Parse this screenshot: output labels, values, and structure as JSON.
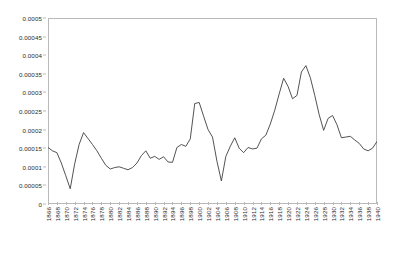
{
  "chart_data": {
    "type": "line",
    "title": "",
    "subtitle": "",
    "xlabel": "",
    "ylabel": "",
    "xlim": [
      1866,
      1940
    ],
    "ylim": [
      0,
      0.0005
    ],
    "grid": false,
    "legend": false,
    "legend_position": "none",
    "line_color": "#404040",
    "y_ticks": [
      0,
      5e-05,
      0.0001,
      0.00015,
      0.0002,
      0.00025,
      0.0003,
      0.00035,
      0.0004,
      0.00045,
      0.0005
    ],
    "y_tick_labels": [
      "0",
      "0.00005",
      "0.0001",
      "0.00015",
      "0.0002",
      "0.00025",
      "0.0003",
      "0.00035",
      "0.0004",
      "0.00045",
      "0.0005"
    ],
    "x_ticks": [
      1866,
      1868,
      1870,
      1872,
      1874,
      1876,
      1878,
      1880,
      1882,
      1884,
      1886,
      1888,
      1890,
      1892,
      1894,
      1896,
      1898,
      1900,
      1902,
      1904,
      1906,
      1908,
      1910,
      1912,
      1914,
      1916,
      1918,
      1920,
      1922,
      1924,
      1926,
      1928,
      1930,
      1932,
      1934,
      1936,
      1938,
      1940
    ],
    "x_tick_labels": [
      "1866",
      "1868",
      "1870",
      "1872",
      "1874",
      "1876",
      "1878",
      "1880",
      "1882",
      "1884",
      "1886",
      "1888",
      "1890",
      "1892",
      "1894",
      "1896",
      "1898",
      "1900",
      "1902",
      "1904",
      "1906",
      "1908",
      "1910",
      "1912",
      "1914",
      "1916",
      "1918",
      "1920",
      "1922",
      "1924",
      "1926",
      "1928",
      "1930",
      "1932",
      "1934",
      "1936",
      "1938",
      "1940"
    ],
    "x": [
      1866,
      1867,
      1868,
      1869,
      1870,
      1871,
      1872,
      1873,
      1874,
      1875,
      1876,
      1877,
      1878,
      1879,
      1880,
      1881,
      1882,
      1883,
      1884,
      1885,
      1886,
      1887,
      1888,
      1889,
      1890,
      1891,
      1892,
      1893,
      1894,
      1895,
      1896,
      1897,
      1898,
      1899,
      1900,
      1901,
      1902,
      1903,
      1904,
      1905,
      1906,
      1907,
      1908,
      1909,
      1910,
      1911,
      1912,
      1913,
      1914,
      1915,
      1916,
      1917,
      1918,
      1919,
      1920,
      1921,
      1922,
      1923,
      1924,
      1925,
      1926,
      1927,
      1928,
      1929,
      1930,
      1931,
      1932,
      1933,
      1934,
      1935,
      1936,
      1937,
      1938,
      1939,
      1940
    ],
    "values": [
      0.000152,
      0.000143,
      0.000138,
      0.00011,
      7.6e-05,
      4.1e-05,
      0.000108,
      0.00016,
      0.000192,
      0.000176,
      0.00016,
      0.000143,
      0.000123,
      0.000104,
      9.4e-05,
      9.8e-05,
      0.0001,
      9.6e-05,
      9.2e-05,
      9.8e-05,
      0.00011,
      0.00013,
      0.000143,
      0.000123,
      0.000128,
      0.00012,
      0.000127,
      0.000113,
      0.000112,
      0.000152,
      0.00016,
      0.000155,
      0.000175,
      0.00027,
      0.000273,
      0.000236,
      0.0002,
      0.00018,
      0.000115,
      6.2e-05,
      0.000128,
      0.000155,
      0.000178,
      0.00015,
      0.000138,
      0.000152,
      0.000148,
      0.00015,
      0.000175,
      0.000185,
      0.000215,
      0.000252,
      0.000296,
      0.000338,
      0.000316,
      0.000283,
      0.000292,
      0.000355,
      0.000372,
      0.00034,
      0.000292,
      0.00024,
      0.000198,
      0.00023,
      0.000238,
      0.000213,
      0.000178,
      0.00018,
      0.000182,
      0.000172,
      0.000163,
      0.000148,
      0.000143,
      0.00015,
      0.000168
    ]
  }
}
